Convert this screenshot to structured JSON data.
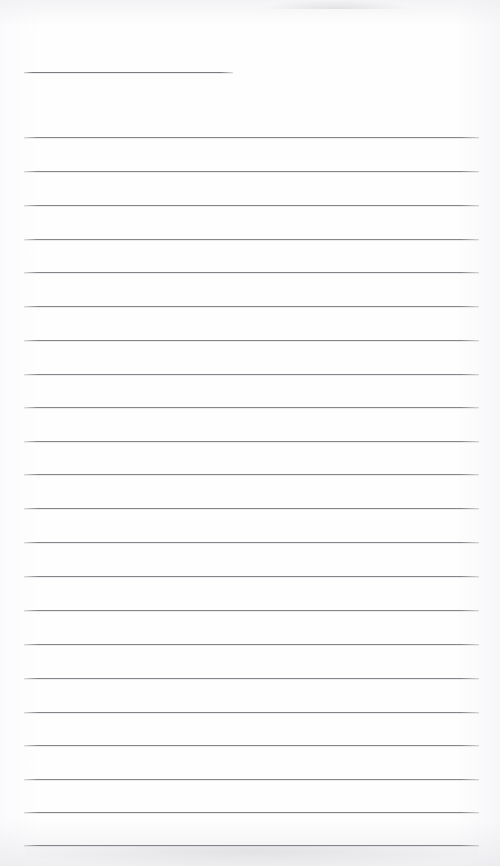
{
  "document": {
    "kind": "scanned-ruled-notebook-page",
    "page_label": "",
    "body_text": "",
    "background_color": "#fefefe",
    "rule_color": "#7e7e84",
    "width": 500,
    "height": 866
  },
  "rules": [
    {
      "name": "header-rule",
      "y": 72,
      "x": 24,
      "width": 209,
      "short": true
    },
    {
      "name": "body-rule-1",
      "y": 137,
      "x": 24,
      "width": 455,
      "short": false
    },
    {
      "name": "body-rule-2",
      "y": 171,
      "x": 24,
      "width": 455,
      "short": false
    },
    {
      "name": "body-rule-3",
      "y": 205,
      "x": 24,
      "width": 455,
      "short": false
    },
    {
      "name": "body-rule-4",
      "y": 239,
      "x": 24,
      "width": 455,
      "short": false
    },
    {
      "name": "body-rule-5",
      "y": 272,
      "x": 24,
      "width": 455,
      "short": false
    },
    {
      "name": "body-rule-6",
      "y": 306,
      "x": 24,
      "width": 455,
      "short": false
    },
    {
      "name": "body-rule-7",
      "y": 340,
      "x": 24,
      "width": 455,
      "short": false
    },
    {
      "name": "body-rule-8",
      "y": 374,
      "x": 24,
      "width": 455,
      "short": false
    },
    {
      "name": "body-rule-9",
      "y": 407,
      "x": 24,
      "width": 455,
      "short": false
    },
    {
      "name": "body-rule-10",
      "y": 441,
      "x": 24,
      "width": 455,
      "short": false
    },
    {
      "name": "body-rule-11",
      "y": 474,
      "x": 24,
      "width": 455,
      "short": false
    },
    {
      "name": "body-rule-12",
      "y": 508,
      "x": 24,
      "width": 455,
      "short": false
    },
    {
      "name": "body-rule-13",
      "y": 542,
      "x": 24,
      "width": 455,
      "short": false
    },
    {
      "name": "body-rule-14",
      "y": 576,
      "x": 24,
      "width": 455,
      "short": false
    },
    {
      "name": "body-rule-15",
      "y": 610,
      "x": 24,
      "width": 455,
      "short": false
    },
    {
      "name": "body-rule-16",
      "y": 644,
      "x": 24,
      "width": 455,
      "short": false
    },
    {
      "name": "body-rule-17",
      "y": 678,
      "x": 24,
      "width": 455,
      "short": false
    },
    {
      "name": "body-rule-18",
      "y": 712,
      "x": 24,
      "width": 455,
      "short": false
    },
    {
      "name": "body-rule-19",
      "y": 745,
      "x": 24,
      "width": 455,
      "short": false
    },
    {
      "name": "body-rule-20",
      "y": 779,
      "x": 24,
      "width": 455,
      "short": false
    },
    {
      "name": "body-rule-21",
      "y": 812,
      "x": 24,
      "width": 455,
      "short": false
    },
    {
      "name": "body-rule-22",
      "y": 845,
      "x": 24,
      "width": 455,
      "short": false
    }
  ]
}
